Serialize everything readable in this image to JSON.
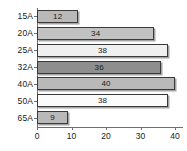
{
  "chart_data": {
    "type": "bar",
    "orientation": "horizontal",
    "title": "",
    "xlabel": "",
    "ylabel": "",
    "categories": [
      "15A",
      "20A",
      "25A",
      "32A",
      "40A",
      "50A",
      "65A"
    ],
    "values": [
      12,
      34,
      38,
      36,
      40,
      38,
      9
    ],
    "value_labels": [
      "12",
      "34",
      "38",
      "36",
      "40",
      "38",
      "9"
    ],
    "bar_colors": [
      "#b9b9b9",
      "#c2c2c2",
      "#f0f0f0",
      "#8e8e8e",
      "#b9b9b9",
      "#fbfbfb",
      "#b9b9b9"
    ],
    "bar_border_color": "#3a3a3a",
    "xlim": [
      0,
      42
    ],
    "xticks": [
      0,
      10,
      20,
      30,
      40
    ],
    "xtick_labels": [
      "0",
      "10",
      "20",
      "30",
      "40"
    ],
    "grid": false,
    "legend": null,
    "axis_color": "#6e6e6e"
  },
  "caption": ""
}
